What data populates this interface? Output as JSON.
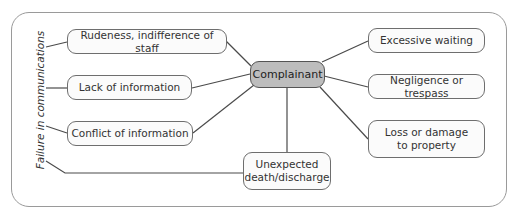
{
  "diagram": {
    "center": {
      "label": "Complainant"
    },
    "group_label": "Failure in communications",
    "left_nodes": [
      {
        "label": "Rudeness, indifference of staff"
      },
      {
        "label": "Lack of information"
      },
      {
        "label": "Conflict of information"
      }
    ],
    "right_nodes": [
      {
        "label": "Excessive waiting"
      },
      {
        "label": "Negligence or trespass"
      },
      {
        "label": "Loss or damage\nto property"
      }
    ],
    "bottom_node": {
      "label": "Unexpected\ndeath/discharge"
    },
    "colors": {
      "center_fill": "#bdbdbd",
      "node_fill": "#fbfbfb",
      "line": "#4a4a4a",
      "frame": "#9a9a9a"
    }
  }
}
